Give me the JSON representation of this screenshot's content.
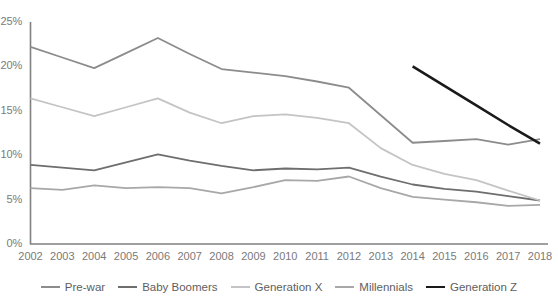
{
  "chart_data": {
    "type": "line",
    "title": "",
    "xlabel": "",
    "ylabel": "",
    "grid": false,
    "legend_position": "bottom",
    "ylim": [
      0,
      25
    ],
    "ytick_labels": [
      "25%",
      "20%",
      "15%",
      "10%",
      "5%",
      "0%"
    ],
    "ytick_values": [
      25,
      20,
      15,
      10,
      5,
      0
    ],
    "categories": [
      "2002",
      "2003",
      "2004",
      "2005",
      "2006",
      "2007",
      "2008",
      "2009",
      "2010",
      "2011",
      "2012",
      "2013",
      "2014",
      "2015",
      "2016",
      "2017",
      "2018"
    ],
    "x": [
      2002,
      2003,
      2004,
      2005,
      2006,
      2007,
      2008,
      2009,
      2010,
      2011,
      2012,
      2013,
      2014,
      2015,
      2016,
      2017,
      2018
    ],
    "series": [
      {
        "name": "Pre-war",
        "color": "#8c8c8c",
        "width": 1.8,
        "values": [
          22.2,
          21.0,
          19.8,
          21.5,
          23.2,
          21.4,
          19.7,
          19.3,
          18.9,
          18.3,
          17.6,
          14.5,
          11.4,
          11.6,
          11.8,
          11.2,
          11.8
        ]
      },
      {
        "name": "Baby Boomers",
        "color": "#6e6e6e",
        "width": 1.8,
        "values": [
          8.9,
          8.6,
          8.3,
          9.2,
          10.1,
          9.4,
          8.8,
          8.3,
          8.5,
          8.4,
          8.6,
          7.6,
          6.7,
          6.2,
          5.9,
          5.4,
          4.9
        ]
      },
      {
        "name": "Generation X",
        "color": "#c4c4c4",
        "width": 1.8,
        "values": [
          16.4,
          15.4,
          14.4,
          15.4,
          16.4,
          14.8,
          13.6,
          14.4,
          14.6,
          14.2,
          13.6,
          10.8,
          8.9,
          7.9,
          7.2,
          6.0,
          4.9
        ]
      },
      {
        "name": "Millennials",
        "color": "#a8a8a8",
        "width": 1.8,
        "values": [
          6.3,
          6.1,
          6.6,
          6.3,
          6.4,
          6.3,
          5.7,
          6.4,
          7.2,
          7.1,
          7.6,
          6.3,
          5.3,
          5.0,
          4.7,
          4.3,
          4.4
        ]
      },
      {
        "name": "Generation Z",
        "color": "#1a1a1a",
        "width": 2.6,
        "values": [
          null,
          null,
          null,
          null,
          null,
          null,
          null,
          null,
          null,
          null,
          null,
          null,
          20.0,
          17.8,
          15.6,
          13.4,
          11.3
        ]
      }
    ]
  },
  "axis": {
    "line_color": "#808080",
    "tick_color": "#7a7a7a"
  }
}
